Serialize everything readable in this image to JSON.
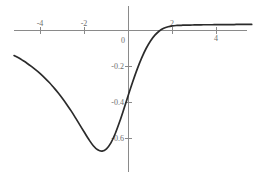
{
  "chart_data": {
    "type": "line",
    "title": "",
    "subtitle": "",
    "xlabel": "",
    "ylabel": "",
    "xlim": [
      -5.2,
      5.7
    ],
    "ylim": [
      -0.82,
      0.09
    ],
    "grid": false,
    "legend": null,
    "legend_position": "none",
    "x_ticks": [
      -4,
      -2,
      0,
      2,
      4
    ],
    "x_tick_labels": [
      "-4",
      "-2",
      "0",
      "2",
      "4"
    ],
    "y_ticks": [
      -0.2,
      -0.4,
      -0.6
    ],
    "y_tick_labels": [
      "-0.2",
      "-0.4",
      "-0.6"
    ],
    "origin_label": "0",
    "curve_color": "#2b2b2b",
    "axis_color": "#8a8a8a",
    "background_color": "#ffffff",
    "annotations": [],
    "series": [
      {
        "name": "curve",
        "x": [
          -5.2,
          -5.0,
          -4.8,
          -4.6,
          -4.4,
          -4.2,
          -4.0,
          -3.8,
          -3.6,
          -3.4,
          -3.2,
          -3.0,
          -2.8,
          -2.6,
          -2.4,
          -2.2,
          -2.0,
          -1.8,
          -1.6,
          -1.4,
          -1.2,
          -1.0,
          -0.8,
          -0.6,
          -0.4,
          -0.2,
          0.0,
          0.2,
          0.4,
          0.6,
          0.8,
          1.0,
          1.2,
          1.4,
          1.6,
          1.8,
          2.0,
          2.2,
          2.4,
          2.6,
          2.8,
          3.0,
          3.2,
          3.4,
          3.6,
          3.8,
          4.0,
          4.2,
          4.4,
          4.6,
          4.8,
          5.0,
          5.2,
          5.4,
          5.6
        ],
        "y": [
          -0.139,
          -0.152,
          -0.167,
          -0.183,
          -0.201,
          -0.22,
          -0.241,
          -0.264,
          -0.289,
          -0.317,
          -0.346,
          -0.378,
          -0.412,
          -0.448,
          -0.487,
          -0.527,
          -0.567,
          -0.606,
          -0.64,
          -0.663,
          -0.67,
          -0.657,
          -0.624,
          -0.572,
          -0.506,
          -0.432,
          -0.356,
          -0.282,
          -0.213,
          -0.152,
          -0.1,
          -0.058,
          -0.026,
          -0.003,
          0.012,
          0.021,
          0.026,
          0.028,
          0.029,
          0.03,
          0.03,
          0.031,
          0.031,
          0.032,
          0.032,
          0.032,
          0.033,
          0.033,
          0.033,
          0.033,
          0.033,
          0.034,
          0.034,
          0.034,
          0.034
        ]
      }
    ],
    "key_points": {
      "minimum": {
        "x": -1.25,
        "y": -0.672
      },
      "y_intercept": {
        "x": 0,
        "y": -0.6
      },
      "x_intercept": {
        "x": 2.0,
        "y": 0
      },
      "right_asymptote": 0.034
    }
  }
}
